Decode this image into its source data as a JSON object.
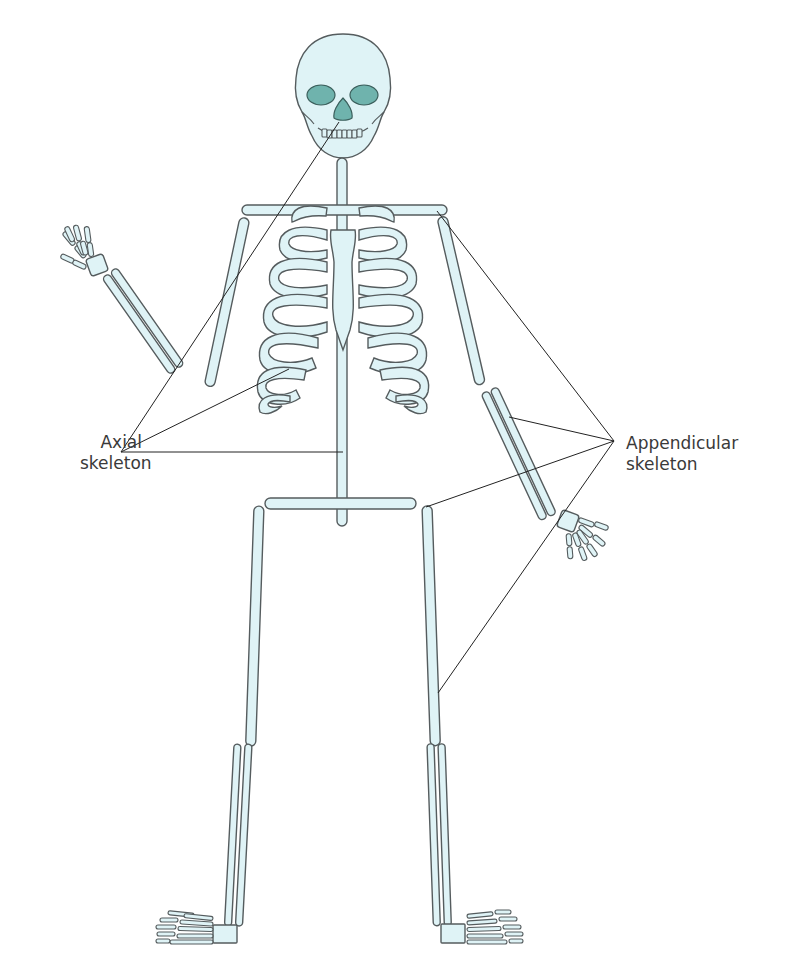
{
  "diagram": {
    "type": "anatomical-skeleton",
    "labels": {
      "axial": {
        "line1": "Axial",
        "line2": "skeleton"
      },
      "appendicular": {
        "line1": "Appendicular",
        "line2": "skeleton"
      }
    },
    "colors": {
      "bone_fill": "#dff3f6",
      "bone_stroke": "#555c5e",
      "socket_fill": "#6fb3ad",
      "leader_line": "#222222",
      "text": "#3a3a3a",
      "background": "#ffffff"
    },
    "parts": {
      "axial": [
        "skull",
        "vertebral-column",
        "rib-cage",
        "sternum"
      ],
      "appendicular": [
        "shoulder-girdle",
        "arms",
        "hands",
        "pelvic-girdle",
        "legs",
        "feet"
      ]
    }
  }
}
